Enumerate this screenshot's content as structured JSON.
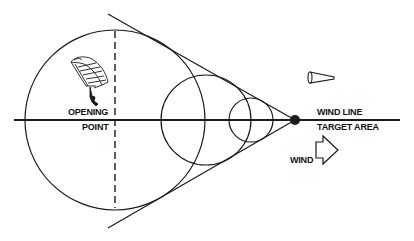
{
  "diagram": {
    "labels": {
      "opening": "OPENING",
      "point": "POINT",
      "wind_line": "WIND LINE",
      "target_area": "TARGET AREA",
      "wind": "WIND"
    },
    "colors": {
      "stroke": "#1a1a1a",
      "background": "#ffffff"
    },
    "elements": {
      "large_circle": "opening-point-circle",
      "medium_circle": "intermediate-circle",
      "small_circle": "near-target-circle",
      "target_dot": "target-point",
      "tangent_lines": "cone-boundary-lines",
      "dashed_line": "opening-point-vertical",
      "parachute_icon": "parachutist",
      "windsock_icon": "windsock",
      "wind_arrow_icon": "wind-direction-arrow"
    }
  }
}
